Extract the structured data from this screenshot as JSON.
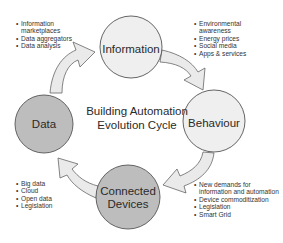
{
  "title": "Building Automation Evolution Cycle",
  "title_lines": [
    "Building Automation",
    "Evolution Cycle"
  ],
  "colors": {
    "light_node_fill": "#efefef",
    "dark_node_fill": "#bdbdbd",
    "node_stroke": "#555555",
    "arrow_fill": "#eaeaea",
    "arrow_stroke": "#666666"
  },
  "nodes": [
    {
      "id": "information",
      "label": "Information",
      "style": "light"
    },
    {
      "id": "behaviour",
      "label": "Behaviour",
      "style": "light"
    },
    {
      "id": "connected-devices",
      "label_lines": [
        "Connected",
        "Devices"
      ],
      "style": "dark"
    },
    {
      "id": "data",
      "label": "Data",
      "style": "dark"
    }
  ],
  "bullet_lists": {
    "data_to_information": [
      "Information marketplaces",
      "Data aggregators",
      "Data analysis"
    ],
    "information_to_behaviour": [
      "Environmental awareness",
      "Energy prices",
      "Social media",
      "Apps & services"
    ],
    "behaviour_to_devices": [
      "New demands for information and automation",
      "Device commoditization",
      "Legislation",
      "Smart Grid"
    ],
    "devices_to_data": [
      "Big data",
      "Cloud",
      "Open data",
      "Legislation"
    ]
  },
  "arrows": [
    {
      "from": "data",
      "to": "information"
    },
    {
      "from": "information",
      "to": "behaviour"
    },
    {
      "from": "behaviour",
      "to": "connected-devices"
    },
    {
      "from": "connected-devices",
      "to": "data"
    }
  ]
}
